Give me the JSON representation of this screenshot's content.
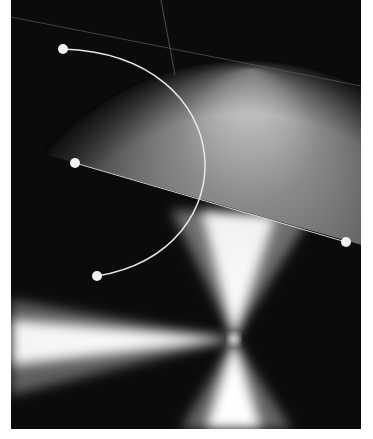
{
  "canvas": {
    "x": 11,
    "y": 0,
    "width": 350,
    "height": 429,
    "background": "#0b0b0b",
    "page_background": "#ffffff"
  },
  "sphere": {
    "type": "radial-gradient",
    "cx": 234,
    "cy": 330,
    "r": 270,
    "highlight_cx": 240,
    "highlight_cy": 70,
    "colors": [
      "#d8d8d8",
      "#6a6a6a",
      "#3a3a3a",
      "#0b0b0b"
    ]
  },
  "conic": {
    "type": "conic-gradient",
    "cx": 223,
    "cy": 339,
    "colors": [
      "#ffffff",
      "#0b0b0b"
    ]
  },
  "guide_lines": [
    {
      "name": "diagonal-guide",
      "x1": 0,
      "y1": 17,
      "x2": 350,
      "y2": 86
    },
    {
      "name": "vertical-guide",
      "x1": 150,
      "y1": 0,
      "x2": 164,
      "y2": 75
    }
  ],
  "curve": {
    "start": {
      "x": 52,
      "y": 49
    },
    "end": {
      "x": 86,
      "y": 276
    },
    "control1": {
      "x": 230,
      "y": 55
    },
    "control2": {
      "x": 240,
      "y": 250
    },
    "color": "#e8e8e8"
  },
  "line": {
    "start": {
      "x": 64,
      "y": 163
    },
    "end": {
      "x": 335,
      "y": 242
    },
    "color": "#d0d0d0"
  },
  "handles": [
    {
      "name": "curve-start-handle",
      "x": 52,
      "y": 49
    },
    {
      "name": "line-start-handle",
      "x": 64,
      "y": 163
    },
    {
      "name": "curve-end-handle",
      "x": 86,
      "y": 276
    },
    {
      "name": "line-end-handle",
      "x": 335,
      "y": 242
    }
  ],
  "handle_style": {
    "radius": 5,
    "color": "#f2f2f2"
  }
}
